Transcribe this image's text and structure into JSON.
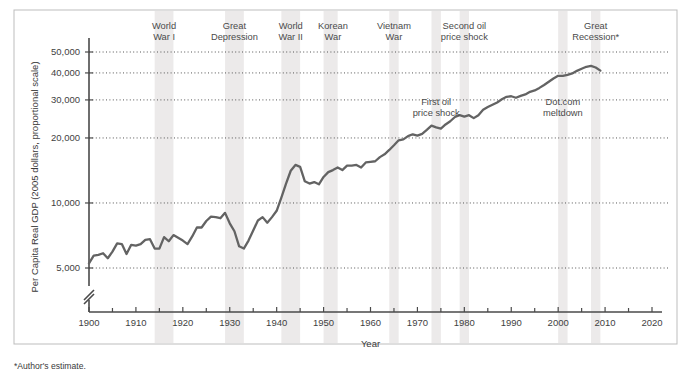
{
  "figure": {
    "footnote": "*Author's estimate.",
    "background_color": "#ffffff",
    "line_color": "#636363",
    "band_color": "#eceaea"
  },
  "chart_data": {
    "type": "line",
    "title": "",
    "subtitle": "",
    "xlabel": "Year",
    "ylabel": "Per Capita Real GDP (2005 dollars, proportional scale)",
    "yscale": "log",
    "ylim": [
      4200,
      60000
    ],
    "xlim": [
      1900,
      2020
    ],
    "grid": true,
    "legend": "none",
    "axis_break": true,
    "y_ticks": [
      {
        "value": 5000,
        "label": "5,000"
      },
      {
        "value": 10000,
        "label": "10,000"
      },
      {
        "value": 20000,
        "label": "20,000"
      },
      {
        "value": 30000,
        "label": "30,000"
      },
      {
        "value": 40000,
        "label": "40,000"
      },
      {
        "value": 50000,
        "label": "50,000"
      }
    ],
    "x_ticks_major": [
      1900,
      1910,
      1920,
      1930,
      1940,
      1950,
      1960,
      1970,
      1980,
      1990,
      2000,
      2010,
      2020
    ],
    "x_ticks_minor": [
      1905,
      1915,
      1925,
      1935,
      1945,
      1955,
      1965,
      1975,
      1985,
      1995,
      2005,
      2015
    ],
    "series": [
      {
        "name": "Per Capita Real GDP",
        "x": [
          1900,
          1901,
          1902,
          1903,
          1904,
          1905,
          1906,
          1907,
          1908,
          1909,
          1910,
          1911,
          1912,
          1913,
          1914,
          1915,
          1916,
          1917,
          1918,
          1919,
          1920,
          1921,
          1922,
          1923,
          1924,
          1925,
          1926,
          1927,
          1928,
          1929,
          1930,
          1931,
          1932,
          1933,
          1934,
          1935,
          1936,
          1937,
          1938,
          1939,
          1940,
          1941,
          1942,
          1943,
          1944,
          1945,
          1946,
          1947,
          1948,
          1949,
          1950,
          1951,
          1952,
          1953,
          1954,
          1955,
          1956,
          1957,
          1958,
          1959,
          1960,
          1961,
          1962,
          1963,
          1964,
          1965,
          1966,
          1967,
          1968,
          1969,
          1970,
          1971,
          1972,
          1973,
          1974,
          1975,
          1976,
          1977,
          1978,
          1979,
          1980,
          1981,
          1982,
          1983,
          1984,
          1985,
          1986,
          1987,
          1988,
          1989,
          1990,
          1991,
          1992,
          1993,
          1994,
          1995,
          1996,
          1997,
          1998,
          1999,
          2000,
          2001,
          2002,
          2003,
          2004,
          2005,
          2006,
          2007,
          2008,
          2009
        ],
        "values": [
          5250,
          5700,
          5750,
          5850,
          5550,
          5950,
          6500,
          6450,
          5800,
          6400,
          6350,
          6450,
          6750,
          6800,
          6150,
          6150,
          6950,
          6650,
          7100,
          6900,
          6700,
          6450,
          7000,
          7700,
          7700,
          8250,
          8650,
          8600,
          8500,
          9000,
          8050,
          7400,
          6300,
          6150,
          6700,
          7450,
          8300,
          8600,
          8100,
          8600,
          9200,
          10600,
          12300,
          14100,
          15000,
          14700,
          12600,
          12300,
          12500,
          12200,
          13200,
          13900,
          14200,
          14600,
          14200,
          14900,
          14900,
          15000,
          14600,
          15400,
          15500,
          15600,
          16300,
          16800,
          17600,
          18500,
          19500,
          19700,
          20400,
          20800,
          20500,
          20900,
          21800,
          22800,
          22400,
          22100,
          23100,
          23900,
          25000,
          25500,
          25100,
          25500,
          24700,
          25500,
          27000,
          27800,
          28500,
          29200,
          30200,
          31000,
          31200,
          30700,
          31300,
          31800,
          32700,
          33200,
          34100,
          35200,
          36400,
          37700,
          38800,
          38800,
          39200,
          39800,
          40900,
          41800,
          42700,
          43100,
          42400,
          41000
        ]
      }
    ],
    "shaded_bands": [
      {
        "label": "World War I",
        "start": 1914,
        "end": 1918
      },
      {
        "label": "Great Depression",
        "start": 1929,
        "end": 1933
      },
      {
        "label": "World War II",
        "start": 1941,
        "end": 1945
      },
      {
        "label": "Korean War",
        "start": 1950,
        "end": 1953
      },
      {
        "label": "Vietnam War",
        "start": 1964,
        "end": 1966
      },
      {
        "label": "First oil price shock",
        "start": 1973,
        "end": 1975
      },
      {
        "label": "Second oil price shock",
        "start": 1979,
        "end": 1981
      },
      {
        "label": "Dot.com meltdown",
        "start": 2000,
        "end": 2002
      },
      {
        "label": "Great Recession",
        "start": 2007,
        "end": 2009
      }
    ],
    "top_annotations": [
      {
        "text_line1": "World",
        "text_line2": "War I",
        "year": 1916
      },
      {
        "text_line1": "Great",
        "text_line2": "Depression",
        "year": 1931
      },
      {
        "text_line1": "World",
        "text_line2": "War II",
        "year": 1943
      },
      {
        "text_line1": "Korean",
        "text_line2": "War",
        "year": 1952
      },
      {
        "text_line1": "Vietnam",
        "text_line2": "War",
        "year": 1965
      },
      {
        "text_line1": "Second oil",
        "text_line2": "price shock",
        "year": 1980
      },
      {
        "text_line1": "Great",
        "text_line2": "Recession*",
        "year": 2008
      }
    ],
    "inner_annotations": [
      {
        "text_line1": "First oil",
        "text_line2": "price shock",
        "year": 1974,
        "y_value": 28500
      },
      {
        "text_line1": "Dot.com",
        "text_line2": "meltdown",
        "year": 2001,
        "y_value": 28500
      }
    ]
  }
}
